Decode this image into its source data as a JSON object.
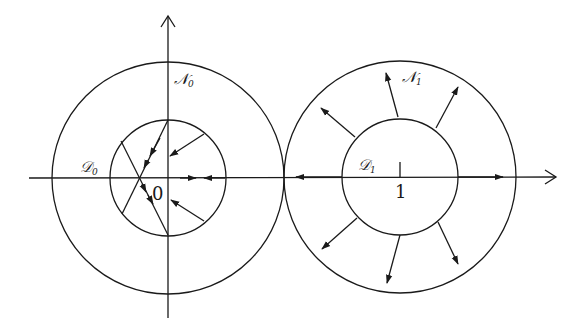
{
  "diagram": {
    "type": "phase-portrait",
    "stroke_color": "#1a1a1a",
    "background": "#ffffff",
    "axes": {
      "horizontal_arrow": true,
      "vertical_arrow": true
    },
    "regions": [
      {
        "id": "left",
        "center_label": "0",
        "outer_label": {
          "letter": "𝒩",
          "subscript": "0"
        },
        "inner_label": {
          "letter": "𝒟",
          "subscript": "0"
        },
        "flow": "inward, converging to a point on the inner disk boundary"
      },
      {
        "id": "right",
        "center_label": "1",
        "outer_label": {
          "letter": "𝒩",
          "subscript": "1"
        },
        "inner_label": {
          "letter": "𝒟",
          "subscript": "1"
        },
        "flow": "outward, radial arrows leaving inner disk"
      }
    ]
  }
}
